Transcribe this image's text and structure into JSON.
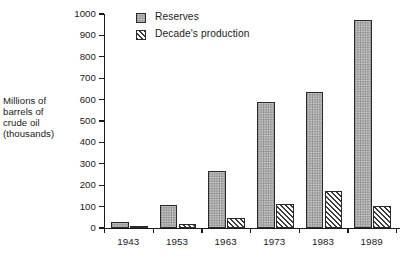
{
  "chart_data": {
    "type": "bar",
    "title": "",
    "xlabel": "",
    "ylabel": "Millions of barrels of crude oil (thousands)",
    "categories": [
      "1943",
      "1953",
      "1963",
      "1973",
      "1983",
      "1989"
    ],
    "series": [
      {
        "name": "Reserves",
        "pattern": "stipple",
        "values": [
          30,
          107,
          267,
          587,
          637,
          970
        ]
      },
      {
        "name": "Decade's production",
        "pattern": "diagonal-hatch",
        "values": [
          8,
          17,
          48,
          113,
          173,
          101
        ]
      }
    ],
    "ylim": [
      0,
      1000
    ],
    "ytick_step": 100,
    "yticks": [
      "1000",
      "900",
      "800",
      "700",
      "600",
      "500",
      "400",
      "300",
      "200",
      "100",
      "0"
    ],
    "grid": false,
    "legend_position": "top-left-inside",
    "colors": {
      "axis": "#1a1a1a",
      "reserves_fill": "#d8d8d8",
      "production_fill": "#ffffff",
      "bar_outline": "#2a2a2a",
      "background": "#ffffff"
    }
  },
  "axis": {
    "y_title_lines": [
      "Millions of",
      "barrels of",
      "crude oil",
      "(thousands)"
    ]
  },
  "legend": {
    "items": [
      {
        "label": "Reserves"
      },
      {
        "label": "Decade's production"
      }
    ]
  },
  "caption": {
    "text": ""
  }
}
